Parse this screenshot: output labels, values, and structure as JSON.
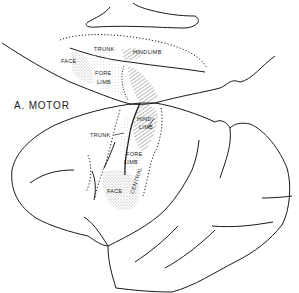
{
  "figure": {
    "title": "A. MOTOR",
    "upper_brain": {
      "labels": {
        "trunk": "TRUNK",
        "hindlimb": "HINDLIMB",
        "face": "FACE",
        "fore": "FORE",
        "limb": "LIMB"
      }
    },
    "lower_brain": {
      "labels": {
        "trunk": "TRUNK",
        "hind": "HIND",
        "limb": "LIMB",
        "fore": "FORE",
        "forelimb_limb": "LIMB",
        "face": "FACE",
        "central": "CENTRAL"
      }
    },
    "colors": {
      "line": "#1a1a1a",
      "stipple": "#9a9a9a",
      "hatch": "#555555",
      "background": "#ffffff"
    }
  }
}
